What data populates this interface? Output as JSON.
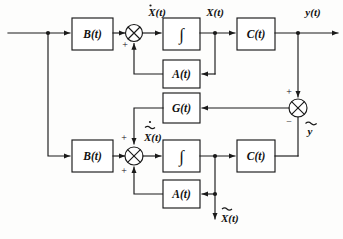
{
  "figure": {
    "type": "control-system-block-diagram",
    "background_color": "#fdfdfc",
    "line_color": "#1a1a1a"
  },
  "signals": {
    "input": "V(t)",
    "state_derivative": "X(t)",
    "state": "X(t)",
    "output": "y(t)",
    "est_state_derivative": "X(t)",
    "est_state": "X(t)",
    "error": "y"
  },
  "blocks": {
    "plant_input_gain": "B(t)",
    "plant_integrator": "∫",
    "plant_feedback": "A(t)",
    "plant_output_gain": "C(t)",
    "observer_gain": "G(t)",
    "observer_input_gain": "B(t)",
    "observer_integrator": "∫",
    "observer_feedback": "A(t)",
    "observer_output_gain": "C(t)"
  },
  "signs": {
    "plant_sum_plus": "+",
    "observer_sum_plus_top": "+",
    "observer_sum_plus_bottom": "+",
    "error_sum_plus": "+",
    "error_sum_minus": "−"
  },
  "overlines": {
    "state_derivative_has_dot": true,
    "est_state_derivative_has_dot_and_tilde": true,
    "est_state_has_tilde": true,
    "error_has_tilde": true
  }
}
